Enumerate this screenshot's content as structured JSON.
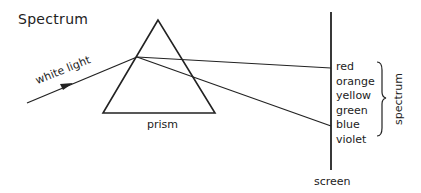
{
  "title": "Spectrum",
  "labels": {
    "incoming": "white light",
    "prism": "prism",
    "screen": "screen",
    "group": "spectrum"
  },
  "colors": [
    "red",
    "orange",
    "yellow",
    "green",
    "blue",
    "violet"
  ],
  "style": {
    "line_color": "#222222"
  }
}
